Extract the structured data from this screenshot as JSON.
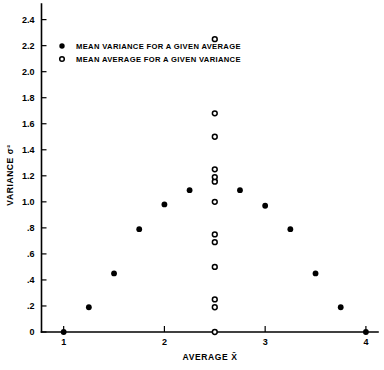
{
  "chart_data": {
    "type": "scatter",
    "title": "",
    "xlabel": "AVERAGE X̄",
    "ylabel": "VARIANCE σ²",
    "xlim": [
      0.78,
      4.12
    ],
    "ylim": [
      0,
      2.52
    ],
    "grid": false,
    "legend_position": "upper-left",
    "x_ticks": [
      1,
      2,
      3,
      4
    ],
    "x_tick_labels": [
      "1",
      "2",
      "3",
      "4"
    ],
    "y_ticks": [
      0,
      0.2,
      0.4,
      0.6,
      0.8,
      1.0,
      1.2,
      1.4,
      1.6,
      1.8,
      2.0,
      2.2,
      2.4
    ],
    "y_tick_labels": [
      "0",
      ".2",
      ".4",
      ".6",
      ".8",
      "1.0",
      "1.2",
      "1.4",
      "1.6",
      "1.8",
      "2.0",
      "2.2",
      "2.4"
    ],
    "series": [
      {
        "name": "MEAN VARIANCE FOR A GIVEN AVERAGE",
        "marker": "filled-circle",
        "color": "#000000",
        "points": [
          {
            "x": 1.0,
            "y": 0.0
          },
          {
            "x": 1.25,
            "y": 0.19
          },
          {
            "x": 1.5,
            "y": 0.45
          },
          {
            "x": 1.75,
            "y": 0.79
          },
          {
            "x": 2.0,
            "y": 0.98
          },
          {
            "x": 2.25,
            "y": 1.09
          },
          {
            "x": 2.5,
            "y": 1.16
          },
          {
            "x": 2.75,
            "y": 1.09
          },
          {
            "x": 3.0,
            "y": 0.97
          },
          {
            "x": 3.25,
            "y": 0.79
          },
          {
            "x": 3.5,
            "y": 0.45
          },
          {
            "x": 3.75,
            "y": 0.19
          },
          {
            "x": 4.0,
            "y": 0.0
          }
        ]
      },
      {
        "name": "MEAN AVERAGE FOR A GIVEN VARIANCE",
        "marker": "open-circle",
        "color": "#000000",
        "points": [
          {
            "x": 2.5,
            "y": 0.0
          },
          {
            "x": 2.5,
            "y": 0.19
          },
          {
            "x": 2.5,
            "y": 0.25
          },
          {
            "x": 2.5,
            "y": 0.5
          },
          {
            "x": 2.5,
            "y": 0.69
          },
          {
            "x": 2.5,
            "y": 0.75
          },
          {
            "x": 2.5,
            "y": 1.0
          },
          {
            "x": 2.5,
            "y": 1.155
          },
          {
            "x": 2.5,
            "y": 1.19
          },
          {
            "x": 2.5,
            "y": 1.25
          },
          {
            "x": 2.5,
            "y": 1.5
          },
          {
            "x": 2.5,
            "y": 1.68
          },
          {
            "x": 2.5,
            "y": 2.25
          }
        ]
      }
    ]
  },
  "legend": {
    "entries": [
      {
        "marker": "filled-circle",
        "label": "MEAN VARIANCE FOR A GIVEN AVERAGE"
      },
      {
        "marker": "open-circle",
        "label": "MEAN AVERAGE FOR A GIVEN VARIANCE"
      }
    ]
  },
  "axes": {
    "x_title": "AVERAGE X̄",
    "y_title": "VARIANCE σ²"
  }
}
